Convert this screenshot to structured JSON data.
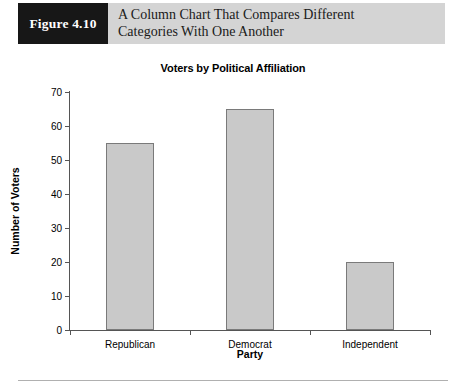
{
  "figure": {
    "badge_label": "Figure 4.10",
    "caption_line1": "A Column Chart That Compares Different",
    "caption_line2": "Categories With One Another",
    "badge_bg": "#171717",
    "band_bg": "#d4d4d4"
  },
  "chart_data": {
    "type": "bar",
    "title": "Voters by Political Affiliation",
    "xlabel": "Party",
    "ylabel": "Number of Voters",
    "categories": [
      "Republican",
      "Democrat",
      "Independent"
    ],
    "values": [
      55,
      65,
      20
    ],
    "ylim": [
      0,
      70
    ],
    "yticks": [
      0,
      10,
      20,
      30,
      40,
      50,
      60,
      70
    ],
    "ytick_labels": [
      "0",
      "10",
      "20",
      "30",
      "40",
      "50",
      "60",
      "70"
    ],
    "grid": false,
    "legend": null,
    "bar_fill": "#c9c9c9",
    "bar_border": "#7a7a7a"
  }
}
